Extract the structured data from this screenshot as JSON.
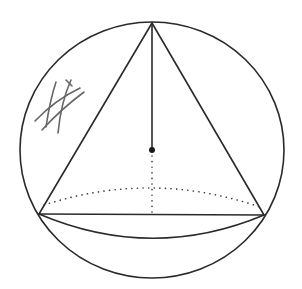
{
  "diagram": {
    "type": "geometry",
    "colors": {
      "line": "#2a2a2a",
      "hidden_line": "#3a3a3a",
      "scribble": "#666666",
      "background": "#ffffff"
    },
    "sphere": {
      "cx": 152,
      "cy": 150,
      "rx": 132,
      "ry": 128
    },
    "cone": {
      "apex": [
        152,
        23
      ],
      "base_left": [
        39,
        214
      ],
      "base_right": [
        264,
        215
      ],
      "base_front_arc_bottom_y": 238,
      "base_back_arc_top_y": 190
    },
    "center_point": [
      152,
      150
    ],
    "height_segment": {
      "solid_from_y": 23,
      "solid_to_y": 150,
      "dotted_to_y": 214
    },
    "annotation": {
      "label": "",
      "kind": "hand-drawn hatch scribble"
    }
  }
}
